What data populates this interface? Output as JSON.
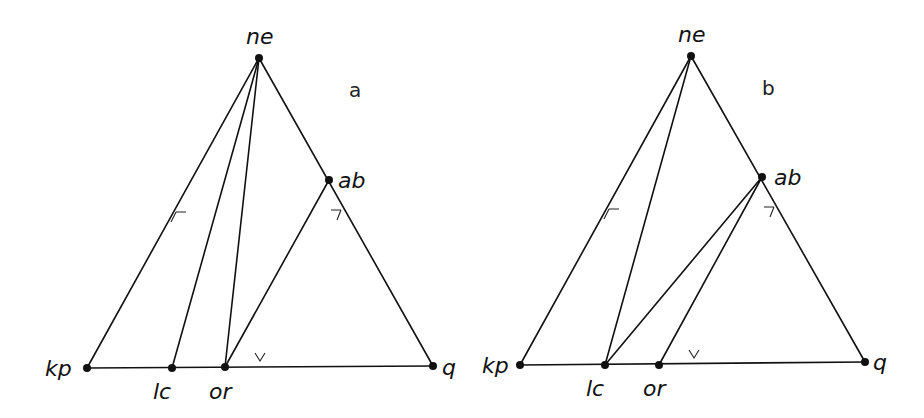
{
  "panels": [
    {
      "id": "a",
      "label": "a",
      "label_pos": [
        349,
        97
      ],
      "nodes": [
        {
          "id": "ne",
          "label": "ne",
          "x": 259,
          "y": 58,
          "lx": 246,
          "ly": 44
        },
        {
          "id": "ab",
          "label": "ab",
          "x": 329,
          "y": 180,
          "lx": 338,
          "ly": 188
        },
        {
          "id": "kp",
          "label": "kp",
          "x": 87,
          "y": 368,
          "lx": 45,
          "ly": 376
        },
        {
          "id": "lc",
          "label": "lc",
          "x": 172,
          "y": 368,
          "lx": 153,
          "ly": 399
        },
        {
          "id": "or",
          "label": "or",
          "x": 225,
          "y": 367,
          "lx": 209,
          "ly": 399
        },
        {
          "id": "q",
          "label": "q",
          "x": 433,
          "y": 366,
          "lx": 442,
          "ly": 375
        }
      ],
      "edges": [
        [
          "ne",
          "kp"
        ],
        [
          "ne",
          "q"
        ],
        [
          "kp",
          "q"
        ],
        [
          "ne",
          "lc"
        ],
        [
          "ne",
          "or"
        ],
        [
          "or",
          "ab"
        ]
      ],
      "ticks": [
        {
          "edge": "ne-kp",
          "x": 176,
          "y": 212,
          "dir": "left"
        },
        {
          "edge": "ne-q",
          "x": 341,
          "y": 210,
          "dir": "right"
        },
        {
          "edge": "kp-q",
          "x": 260,
          "y": 361,
          "dir": "down"
        }
      ]
    },
    {
      "id": "b",
      "label": "b",
      "label_pos": [
        762,
        95
      ],
      "nodes": [
        {
          "id": "ne",
          "label": "ne",
          "x": 691,
          "y": 56,
          "lx": 678,
          "ly": 42
        },
        {
          "id": "ab",
          "label": "ab",
          "x": 762,
          "y": 177,
          "lx": 774,
          "ly": 185
        },
        {
          "id": "kp",
          "label": "kp",
          "x": 520,
          "y": 365,
          "lx": 482,
          "ly": 373
        },
        {
          "id": "lc",
          "label": "lc",
          "x": 605,
          "y": 365,
          "lx": 586,
          "ly": 396
        },
        {
          "id": "or",
          "label": "or",
          "x": 659,
          "y": 365,
          "lx": 643,
          "ly": 396
        },
        {
          "id": "q",
          "label": "q",
          "x": 865,
          "y": 362,
          "lx": 873,
          "ly": 370
        }
      ],
      "edges": [
        [
          "ne",
          "kp"
        ],
        [
          "ne",
          "q"
        ],
        [
          "kp",
          "q"
        ],
        [
          "ne",
          "lc"
        ],
        [
          "lc",
          "ab"
        ],
        [
          "or",
          "ab"
        ]
      ],
      "ticks": [
        {
          "edge": "ne-kp",
          "x": 609,
          "y": 209,
          "dir": "left"
        },
        {
          "edge": "ne-q",
          "x": 774,
          "y": 207,
          "dir": "right"
        },
        {
          "edge": "kp-q",
          "x": 694,
          "y": 358,
          "dir": "down"
        }
      ]
    }
  ]
}
